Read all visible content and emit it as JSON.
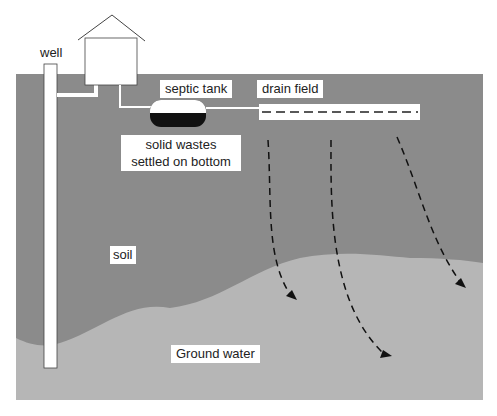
{
  "labels": {
    "well": "well",
    "septic_tank": "septic tank",
    "drain_field": "drain field",
    "solid_wastes_line1": "solid wastes",
    "solid_wastes_line2": "settled on bottom",
    "soil": "soil",
    "ground_water": "Ground water"
  },
  "colors": {
    "soil": "#8b8b8b",
    "ground_water": "#b6b6b6",
    "structure": "#ffffff",
    "sludge": "#111111",
    "line": "#333333"
  }
}
